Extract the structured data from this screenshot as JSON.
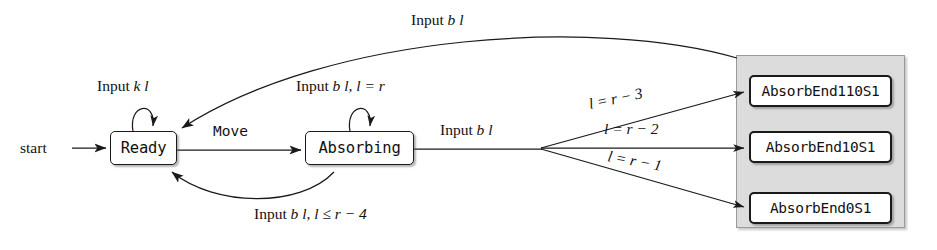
{
  "diagram": {
    "start_label": "start",
    "states": [
      {
        "id": "ready",
        "label": "Ready"
      },
      {
        "id": "absorbing",
        "label": "Absorbing"
      }
    ],
    "end_states": [
      {
        "id": "absorbend110s1",
        "label": "AbsorbEnd110S1"
      },
      {
        "id": "absorbend10s1",
        "label": "AbsorbEnd10S1"
      },
      {
        "id": "absorbend0s1",
        "label": "AbsorbEnd0S1"
      }
    ],
    "edges": {
      "ready_self": {
        "prefix": "Input",
        "expr": "k l"
      },
      "ready_to_absorbing": {
        "label": "Move"
      },
      "absorbing_self": {
        "prefix": "Input",
        "expr": "b l, l = r"
      },
      "absorbing_out": {
        "prefix": "Input",
        "expr": "b l"
      },
      "top_return": {
        "prefix": "Input",
        "expr": "b l"
      },
      "bottom_return": {
        "prefix": "Input",
        "expr": "b l, l ≤ r − 4"
      },
      "to_end_110": {
        "expr": "l = r − 3"
      },
      "to_end_10": {
        "expr": "l = r − 2"
      },
      "to_end_0": {
        "expr": "l = r − 1"
      }
    },
    "colors": {
      "stroke": "#1a1a1a",
      "panel_fill": "#dcdcdc",
      "panel_border": "#9a9a9a",
      "background": "#ffffff"
    }
  }
}
